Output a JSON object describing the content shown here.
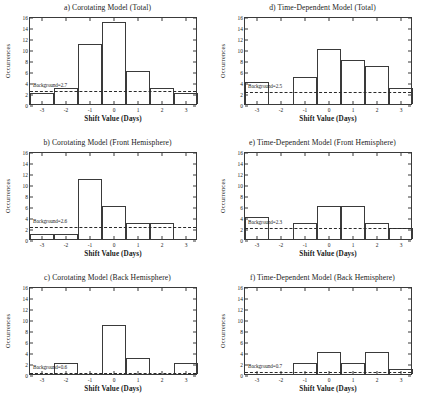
{
  "figure": {
    "xlabel": "Shift Value (Days)",
    "ylabel": "Occurrences",
    "yticks": [
      "0",
      "2",
      "4",
      "6",
      "8",
      "10",
      "12",
      "14",
      "16"
    ],
    "xticks": [
      "-3",
      "-2",
      "-1",
      "0",
      "1",
      "2",
      "3"
    ]
  },
  "chart_data": [
    {
      "type": "bar",
      "panel": "a",
      "title": "a)  Corotating Model (Total)",
      "xlabel": "Shift Value (Days)",
      "ylabel": "Occurrences",
      "categories": [
        "-3",
        "-2",
        "-1",
        "0",
        "1",
        "2",
        "3"
      ],
      "values": [
        2,
        3,
        11,
        15,
        6,
        3,
        2
      ],
      "ylim": [
        0,
        16
      ],
      "xlim": [
        -3.5,
        3.5
      ],
      "grid": false,
      "background_level": 2.7,
      "background_label": "Background=2.7"
    },
    {
      "type": "bar",
      "panel": "b",
      "title": "b)  Corotating Model (Front Hemisphere)",
      "xlabel": "Shift Value (Days)",
      "ylabel": "Occurrences",
      "categories": [
        "-3",
        "-2",
        "-1",
        "0",
        "1",
        "2",
        "3"
      ],
      "values": [
        1,
        1,
        11,
        6,
        3,
        3,
        0
      ],
      "ylim": [
        0,
        16
      ],
      "xlim": [
        -3.5,
        3.5
      ],
      "grid": false,
      "background_level": 2.6,
      "background_label": "Background=2.6"
    },
    {
      "type": "bar",
      "panel": "c",
      "title": "c)  Corotating Model (Back Hemisphere)",
      "xlabel": "Shift Value (Days)",
      "ylabel": "Occurrences",
      "categories": [
        "-3",
        "-2",
        "-1",
        "0",
        "1",
        "2",
        "3"
      ],
      "values": [
        0,
        2,
        0,
        9,
        3,
        0,
        2
      ],
      "ylim": [
        0,
        16
      ],
      "xlim": [
        -3.5,
        3.5
      ],
      "grid": false,
      "background_level": 0.6,
      "background_label": "Background=0.6"
    },
    {
      "type": "bar",
      "panel": "d",
      "title": "d)  Time-Dependent Model (Total)",
      "xlabel": "Shift Value (Days)",
      "ylabel": "Occurrences",
      "categories": [
        "-3",
        "-2",
        "-1",
        "0",
        "1",
        "2",
        "3"
      ],
      "values": [
        4,
        0,
        5,
        10,
        8,
        7,
        3
      ],
      "ylim": [
        0,
        16
      ],
      "xlim": [
        -3.5,
        3.5
      ],
      "grid": false,
      "background_level": 2.5,
      "background_label": "Background=2.5"
    },
    {
      "type": "bar",
      "panel": "e",
      "title": "e)  Time-Dependent Model (Front Hemisphere)",
      "xlabel": "Shift Value (Days)",
      "ylabel": "Occurrences",
      "categories": [
        "-3",
        "-2",
        "-1",
        "0",
        "1",
        "2",
        "3"
      ],
      "values": [
        4,
        0,
        3,
        6,
        6,
        3,
        2
      ],
      "ylim": [
        0,
        16
      ],
      "xlim": [
        -3.5,
        3.5
      ],
      "grid": false,
      "background_level": 2.3,
      "background_label": "Background=2.3"
    },
    {
      "type": "bar",
      "panel": "f",
      "title": "f)  Time-Dependent Model (Back Hemisphere)",
      "xlabel": "Shift Value (Days)",
      "ylabel": "Occurrences",
      "categories": [
        "-3",
        "-2",
        "-1",
        "0",
        "1",
        "2",
        "3"
      ],
      "values": [
        0,
        0,
        2,
        4,
        2,
        4,
        1
      ],
      "ylim": [
        0,
        16
      ],
      "xlim": [
        -3.5,
        3.5
      ],
      "grid": false,
      "background_level": 0.7,
      "background_label": "Background=0.7"
    }
  ]
}
